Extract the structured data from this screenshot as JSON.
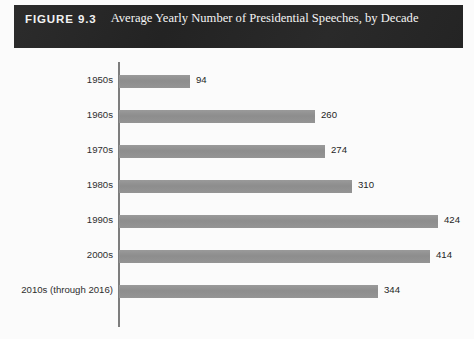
{
  "header": {
    "figure_number": "FIGURE 9.3",
    "title": "Average Yearly Number of Presidential Speeches, by Decade"
  },
  "colors": {
    "header_background": "#262626",
    "header_text": "#f2f2f2",
    "bar_fill": "#909090",
    "axis_line": "#7d7d7d",
    "label_text": "#2e2e2e",
    "page_background": "#fbfbfb"
  },
  "chart_data": {
    "type": "bar",
    "orientation": "horizontal",
    "title": "Average Yearly Number of Presidential Speeches, by Decade",
    "subtitle": "",
    "xlabel": "",
    "ylabel": "",
    "categories": [
      "1950s",
      "1960s",
      "1970s",
      "1980s",
      "1990s",
      "2000s",
      "2010s (through 2016)"
    ],
    "values": [
      94,
      260,
      274,
      310,
      424,
      414,
      344
    ],
    "value_labels": [
      "94",
      "260",
      "274",
      "310",
      "424",
      "414",
      "344"
    ],
    "xlim": [
      0,
      424
    ],
    "ylim": null,
    "grid": false,
    "legend": false,
    "legend_position": "none",
    "tick_labels_x": [],
    "annotations": []
  }
}
